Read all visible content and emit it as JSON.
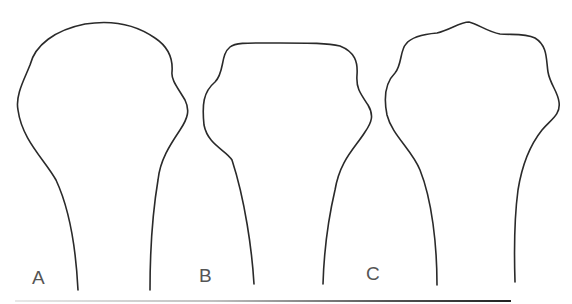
{
  "figure": {
    "panels": [
      {
        "id": "A",
        "label": "A"
      },
      {
        "id": "B",
        "label": "B"
      },
      {
        "id": "C",
        "label": "C"
      }
    ],
    "colors": {
      "outline": "#2a2a2a",
      "label": "#555555",
      "background": "#ffffff"
    }
  }
}
